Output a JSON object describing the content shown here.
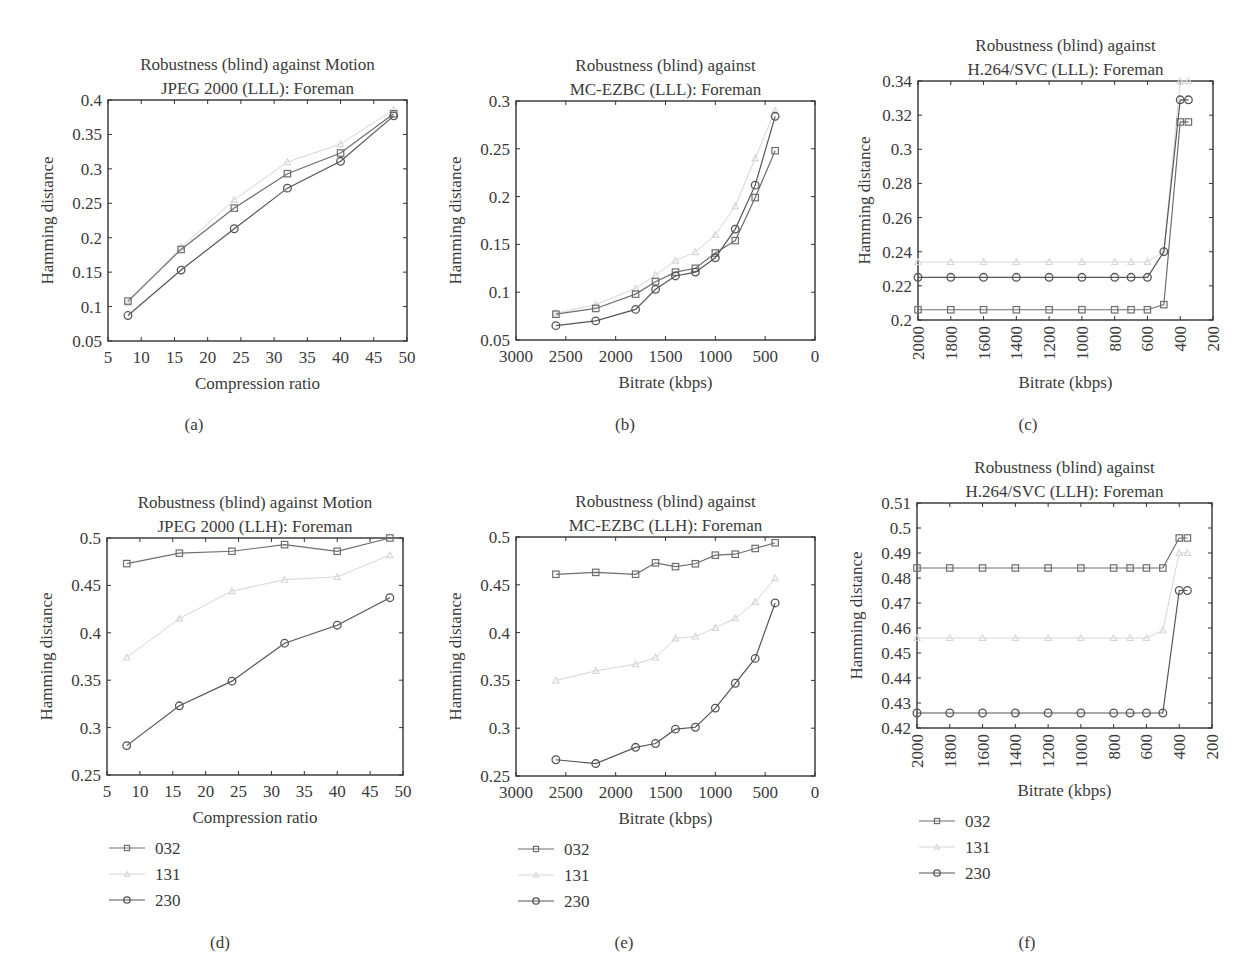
{
  "figure": {
    "captions": [
      "(a)",
      "(b)",
      "(c)",
      "(d)",
      "(e)",
      "(f)"
    ]
  },
  "legend": {
    "entries": [
      {
        "name": "032",
        "marker": "square",
        "color": "#6e6e6e"
      },
      {
        "name": "131",
        "marker": "triangle",
        "color": "#d6d6d6"
      },
      {
        "name": "230",
        "marker": "circle",
        "color": "#555555"
      }
    ]
  },
  "chart_data": [
    {
      "id": "a",
      "type": "line",
      "title": [
        "Robustness (blind) against Motion",
        "JPEG 2000 (LLL): Foreman"
      ],
      "xlabel": "Compression ratio",
      "ylabel": "Hamming distance",
      "xlim": [
        5,
        50
      ],
      "ylim": [
        0.05,
        0.4
      ],
      "xticks": [
        5,
        10,
        15,
        20,
        25,
        30,
        35,
        40,
        45,
        50
      ],
      "yticks": [
        0.05,
        0.1,
        0.15,
        0.2,
        0.25,
        0.3,
        0.35,
        0.4
      ],
      "ytick_labels": [
        "0.05",
        "0.1",
        "0.15",
        "0.2",
        "0.25",
        "0.3",
        "0.35",
        "0.4"
      ],
      "x_reversed": false,
      "xtick_rotated": false,
      "grid": false,
      "legend": false,
      "x": [
        8,
        16,
        24,
        32,
        40,
        48
      ],
      "series": [
        {
          "name": "032",
          "values": [
            0.108,
            0.183,
            0.243,
            0.293,
            0.323,
            0.38
          ]
        },
        {
          "name": "131",
          "values": [
            0.105,
            0.186,
            0.255,
            0.31,
            0.336,
            0.386
          ]
        },
        {
          "name": "230",
          "values": [
            0.087,
            0.153,
            0.213,
            0.272,
            0.311,
            0.377
          ]
        }
      ]
    },
    {
      "id": "b",
      "type": "line",
      "title": [
        "Robustness (blind) against",
        "MC-EZBC (LLL): Foreman"
      ],
      "xlabel": "Bitrate (kbps)",
      "ylabel": "Hamming distance",
      "xlim": [
        3000,
        0
      ],
      "ylim": [
        0.05,
        0.3
      ],
      "xticks": [
        3000,
        2500,
        2000,
        1500,
        1000,
        500,
        0
      ],
      "yticks": [
        0.05,
        0.1,
        0.15,
        0.2,
        0.25,
        0.3
      ],
      "ytick_labels": [
        "0.05",
        "0.1",
        "0.15",
        "0.2",
        "0.25",
        "0.3"
      ],
      "x_reversed": true,
      "xtick_rotated": false,
      "grid": false,
      "legend": false,
      "x": [
        2600,
        2200,
        1800,
        1600,
        1400,
        1200,
        1000,
        800,
        600,
        400
      ],
      "series": [
        {
          "name": "032",
          "values": [
            0.077,
            0.083,
            0.098,
            0.111,
            0.121,
            0.125,
            0.141,
            0.154,
            0.199,
            0.248
          ]
        },
        {
          "name": "131",
          "values": [
            0.078,
            0.087,
            0.104,
            0.118,
            0.133,
            0.142,
            0.16,
            0.19,
            0.24,
            0.29
          ]
        },
        {
          "name": "230",
          "values": [
            0.065,
            0.07,
            0.082,
            0.103,
            0.117,
            0.121,
            0.136,
            0.166,
            0.212,
            0.284
          ]
        }
      ]
    },
    {
      "id": "c",
      "type": "line",
      "title": [
        "Robustness (blind) against",
        "H.264/SVC (LLL): Foreman"
      ],
      "xlabel": "Bitrate (kbps)",
      "ylabel": "Hamming distance",
      "xlim": [
        2000,
        200
      ],
      "ylim": [
        0.2,
        0.34
      ],
      "xticks": [
        2000,
        1800,
        1600,
        1400,
        1200,
        1000,
        800,
        600,
        400,
        200
      ],
      "yticks": [
        0.2,
        0.22,
        0.24,
        0.26,
        0.28,
        0.3,
        0.32,
        0.34
      ],
      "ytick_labels": [
        "0.2",
        "0.22",
        "0.24",
        "0.26",
        "0.28",
        "0.3",
        "0.32",
        "0.34"
      ],
      "x_reversed": true,
      "xtick_rotated": true,
      "grid": false,
      "legend": false,
      "x": [
        2000,
        1800,
        1600,
        1400,
        1200,
        1000,
        800,
        700,
        600,
        500,
        400,
        350
      ],
      "series": [
        {
          "name": "032",
          "values": [
            0.206,
            0.206,
            0.206,
            0.206,
            0.206,
            0.206,
            0.206,
            0.206,
            0.206,
            0.209,
            0.316,
            0.316
          ]
        },
        {
          "name": "131",
          "values": [
            0.234,
            0.234,
            0.234,
            0.234,
            0.234,
            0.234,
            0.234,
            0.234,
            0.234,
            0.24,
            0.34,
            0.34
          ]
        },
        {
          "name": "230",
          "values": [
            0.225,
            0.225,
            0.225,
            0.225,
            0.225,
            0.225,
            0.225,
            0.225,
            0.225,
            0.24,
            0.329,
            0.329
          ]
        }
      ]
    },
    {
      "id": "d",
      "type": "line",
      "title": [
        "Robustness (blind) against Motion",
        "JPEG 2000 (LLH): Foreman"
      ],
      "xlabel": "Compression ratio",
      "ylabel": "Hamming distance",
      "xlim": [
        5,
        50
      ],
      "ylim": [
        0.25,
        0.5
      ],
      "xticks": [
        5,
        10,
        15,
        20,
        25,
        30,
        35,
        40,
        45,
        50
      ],
      "yticks": [
        0.25,
        0.3,
        0.35,
        0.4,
        0.45,
        0.5
      ],
      "ytick_labels": [
        "0.25",
        "0.3",
        "0.35",
        "0.4",
        "0.45",
        "0.5"
      ],
      "x_reversed": false,
      "xtick_rotated": false,
      "grid": false,
      "legend": true,
      "legend_position": "below",
      "x": [
        8,
        16,
        24,
        32,
        40,
        48
      ],
      "series": [
        {
          "name": "032",
          "values": [
            0.473,
            0.484,
            0.486,
            0.493,
            0.486,
            0.5
          ]
        },
        {
          "name": "131",
          "values": [
            0.374,
            0.415,
            0.444,
            0.456,
            0.459,
            0.482
          ]
        },
        {
          "name": "230",
          "values": [
            0.281,
            0.323,
            0.349,
            0.389,
            0.408,
            0.437
          ]
        }
      ]
    },
    {
      "id": "e",
      "type": "line",
      "title": [
        "Robustness (blind) against",
        "MC-EZBC (LLH): Foreman"
      ],
      "xlabel": "Bitrate (kbps)",
      "ylabel": "Hamming distance",
      "xlim": [
        3000,
        0
      ],
      "ylim": [
        0.25,
        0.5
      ],
      "xticks": [
        3000,
        2500,
        2000,
        1500,
        1000,
        500,
        0
      ],
      "yticks": [
        0.25,
        0.3,
        0.35,
        0.4,
        0.45,
        0.5
      ],
      "ytick_labels": [
        "0.25",
        "0.3",
        "0.35",
        "0.4",
        "0.45",
        "0.5"
      ],
      "x_reversed": true,
      "xtick_rotated": false,
      "grid": false,
      "legend": true,
      "legend_position": "below",
      "x": [
        2600,
        2200,
        1800,
        1600,
        1400,
        1200,
        1000,
        800,
        600,
        400
      ],
      "series": [
        {
          "name": "032",
          "values": [
            0.461,
            0.463,
            0.461,
            0.473,
            0.469,
            0.472,
            0.481,
            0.482,
            0.488,
            0.494
          ]
        },
        {
          "name": "131",
          "values": [
            0.35,
            0.36,
            0.367,
            0.374,
            0.394,
            0.396,
            0.405,
            0.415,
            0.432,
            0.457
          ]
        },
        {
          "name": "230",
          "values": [
            0.267,
            0.263,
            0.28,
            0.284,
            0.299,
            0.301,
            0.321,
            0.347,
            0.373,
            0.431
          ]
        }
      ]
    },
    {
      "id": "f",
      "type": "line",
      "title": [
        "Robustness (blind) against",
        "H.264/SVC (LLH): Foreman"
      ],
      "xlabel": "Bitrate (kbps)",
      "ylabel": "Hamming distance",
      "xlim": [
        2000,
        200
      ],
      "ylim": [
        0.42,
        0.51
      ],
      "xticks": [
        2000,
        1800,
        1600,
        1400,
        1200,
        1000,
        800,
        600,
        400,
        200
      ],
      "yticks": [
        0.42,
        0.43,
        0.44,
        0.45,
        0.46,
        0.47,
        0.48,
        0.49,
        0.5,
        0.51
      ],
      "ytick_labels": [
        "0.42",
        "0.43",
        "0.44",
        "0.45",
        "0.46",
        "0.47",
        "0.48",
        "0.49",
        "0.5",
        "0.51"
      ],
      "x_reversed": true,
      "xtick_rotated": true,
      "grid": false,
      "legend": true,
      "legend_position": "below",
      "x": [
        2000,
        1800,
        1600,
        1400,
        1200,
        1000,
        800,
        700,
        600,
        500,
        400,
        350
      ],
      "series": [
        {
          "name": "032",
          "values": [
            0.484,
            0.484,
            0.484,
            0.484,
            0.484,
            0.484,
            0.484,
            0.484,
            0.484,
            0.484,
            0.496,
            0.496
          ]
        },
        {
          "name": "131",
          "values": [
            0.456,
            0.456,
            0.456,
            0.456,
            0.456,
            0.456,
            0.456,
            0.456,
            0.456,
            0.459,
            0.49,
            0.49
          ]
        },
        {
          "name": "230",
          "values": [
            0.426,
            0.426,
            0.426,
            0.426,
            0.426,
            0.426,
            0.426,
            0.426,
            0.426,
            0.426,
            0.475,
            0.475
          ]
        }
      ]
    }
  ]
}
